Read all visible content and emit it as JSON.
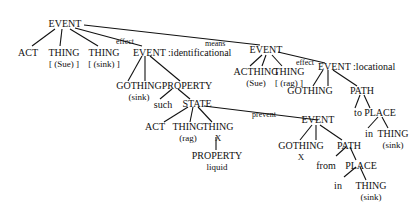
{
  "diagram": {
    "type": "conceptual-structure-tree",
    "nodes": {
      "root": {
        "label": "EVENT"
      },
      "act1": {
        "label": "ACT"
      },
      "thing_sue": {
        "label": "THING",
        "sub": "[ (Sue) ]"
      },
      "thing_sink": {
        "label": "THING",
        "sub": "[ (sink) ]"
      },
      "ev_ident": {
        "label": "EVENT :identificational"
      },
      "gothing1": {
        "label": "GOTHING",
        "sub": "(sink)"
      },
      "property1": {
        "label": "PROPERTY"
      },
      "such": {
        "label": "such"
      },
      "state": {
        "label": "STATE"
      },
      "act2": {
        "label": "ACT"
      },
      "thing_rag1": {
        "label": "THING",
        "sub": "(rag)"
      },
      "thing_x": {
        "label": "THING",
        "sub": "X"
      },
      "property_liquid": {
        "label": "PROPERTY",
        "sub": "liquid"
      },
      "ev_prevent": {
        "label": "EVENT"
      },
      "gothing_x": {
        "label": "GOTHING",
        "sub": "X"
      },
      "path_from": {
        "label": "PATH"
      },
      "from": {
        "label": "from"
      },
      "place_from": {
        "label": "PLACE"
      },
      "in1": {
        "label": "in"
      },
      "thing_sink2": {
        "label": "THING",
        "sub": "(sink)"
      },
      "ev_means": {
        "label": "EVENT"
      },
      "acthing": {
        "label": "ACTHING",
        "sub": "(Sue)"
      },
      "thing_rag2": {
        "label": "THING",
        "sub": "[ (rag) ]"
      },
      "ev_loc": {
        "label": "EVENT :locational"
      },
      "gothing2": {
        "label": "GOTHING"
      },
      "path_to": {
        "label": "PATH"
      },
      "to": {
        "label": "to"
      },
      "place_to": {
        "label": "PLACE"
      },
      "in2": {
        "label": "in"
      },
      "thing_sink3": {
        "label": "THING",
        "sub": "(sink)"
      }
    },
    "edge_labels": {
      "effect1": "effect",
      "means": "means",
      "effect2": "effect",
      "prevent": "prevent"
    }
  }
}
